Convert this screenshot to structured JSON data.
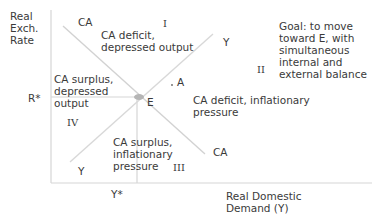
{
  "diagram": {
    "type": "swan-diagram",
    "axes": {
      "y_label": [
        "Real",
        "Exch.",
        "Rate"
      ],
      "x_label": [
        "Real Domestic",
        "Demand (Y)"
      ],
      "y_tick": "R*",
      "x_tick": "Y*"
    },
    "lines": {
      "ca": {
        "label_top": "CA",
        "label_bottom": "CA"
      },
      "y": {
        "label_top": "Y",
        "label_bottom": "Y"
      }
    },
    "points": {
      "equilibrium": "E",
      "a": "A"
    },
    "zones": [
      {
        "numeral": "I",
        "text": [
          "CA deficit,",
          "depressed output"
        ]
      },
      {
        "numeral": "II",
        "text": [
          "CA deficit, inflationary",
          "pressure"
        ]
      },
      {
        "numeral": "III",
        "text": [
          "CA surplus,",
          "inflationary",
          "pressure"
        ]
      },
      {
        "numeral": "IV",
        "text": [
          "CA surplus,",
          "depressed",
          "output"
        ]
      }
    ],
    "goal_note": [
      "Goal: to move",
      "toward E, with",
      "simultaneous",
      "internal and",
      "external balance"
    ],
    "colors": {
      "axis": "#d0d0d0",
      "line": "#d6d6d6",
      "point": "#b0b0b0",
      "text": "#3a3a3a"
    }
  }
}
